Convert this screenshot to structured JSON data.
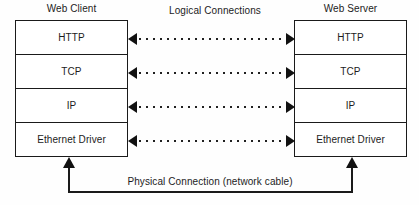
{
  "diagram": {
    "client": {
      "caption": "Web Client",
      "layers": [
        "HTTP",
        "TCP",
        "IP",
        "Ethernet Driver"
      ]
    },
    "server": {
      "caption": "Web Server",
      "layers": [
        "HTTP",
        "TCP",
        "IP",
        "Ethernet Driver"
      ]
    },
    "logical": {
      "caption": "Logical Connections",
      "connection_count": 4,
      "line_style": "dotted",
      "arrowheads": "both"
    },
    "physical": {
      "caption": "Physical Connection (network cable)",
      "arrowheads": "both-up"
    },
    "colors": {
      "stroke": "#1a1a1a",
      "text": "#1c1c1c",
      "background": "#fefefe"
    }
  }
}
